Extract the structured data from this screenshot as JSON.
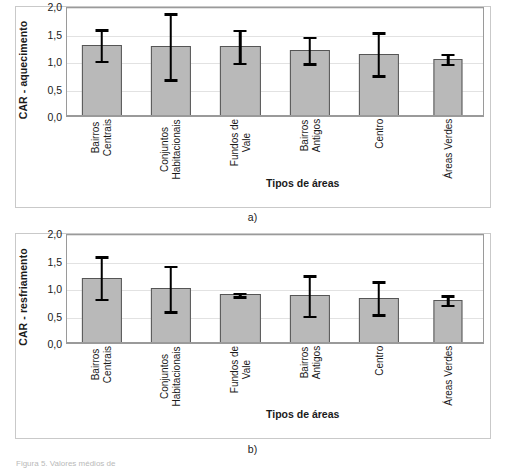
{
  "figure": {
    "panel_label_a": "a)",
    "panel_label_b": "b)",
    "caption_partial": "Figura 5. Valores médios de"
  },
  "axis": {
    "xlabel": "Tipos de áreas",
    "ticks": [
      "2,0",
      "1,5",
      "1,0",
      "0,5",
      "0,0"
    ]
  },
  "chart_data": [
    {
      "type": "bar",
      "title": "",
      "panel": "a)",
      "ylabel": "CAR - aquecimento",
      "xlabel": "Tipos de áreas",
      "ylim": [
        0,
        2.0
      ],
      "ytick_values": [
        0.0,
        0.5,
        1.0,
        1.5,
        2.0
      ],
      "ytick_labels": [
        "0,0",
        "0,5",
        "1,0",
        "1,5",
        "2,0"
      ],
      "grid": true,
      "legend": "none",
      "error_bars": "symmetric",
      "categories": [
        "Bairros Centrais",
        "Conjuntos Habitacionais",
        "Fundos de Vale",
        "Bairros Antigos",
        "Centro",
        "Áreas Verdes"
      ],
      "category_lines": [
        [
          "Bairros",
          "Centrais"
        ],
        [
          "Conjuntos",
          "Habitacionais"
        ],
        [
          "Fundos de",
          "Vale"
        ],
        [
          "Bairros",
          "Antigos"
        ],
        [
          "Centro"
        ],
        [
          "Áreas Verdes"
        ]
      ],
      "values": [
        1.31,
        1.29,
        1.29,
        1.22,
        1.15,
        1.06
      ],
      "errors": [
        0.29,
        0.6,
        0.3,
        0.24,
        0.39,
        0.09
      ],
      "err_low": [
        1.02,
        0.69,
        0.99,
        0.98,
        0.76,
        0.97
      ],
      "err_high": [
        1.6,
        1.89,
        1.59,
        1.46,
        1.54,
        1.15
      ]
    },
    {
      "type": "bar",
      "title": "",
      "panel": "b)",
      "ylabel": "CAR - resfriamento",
      "xlabel": "Tipos de áreas",
      "ylim": [
        0,
        2.0
      ],
      "ytick_values": [
        0.0,
        0.5,
        1.0,
        1.5,
        2.0
      ],
      "ytick_labels": [
        "0,0",
        "0,5",
        "1,0",
        "1,5",
        "2,0"
      ],
      "grid": true,
      "legend": "none",
      "error_bars": "symmetric",
      "categories": [
        "Bairros Centrais",
        "Conjuntos Habitacionais",
        "Fundos de Vale",
        "Bairros Antigos",
        "Centro",
        "Áreas Verdes"
      ],
      "category_lines": [
        [
          "Bairros",
          "Centrais"
        ],
        [
          "Conjuntos",
          "Habitacionais"
        ],
        [
          "Fundos de",
          "Vale"
        ],
        [
          "Bairros",
          "Antigos"
        ],
        [
          "Centro"
        ],
        [
          "Áreas Verdes"
        ]
      ],
      "values": [
        1.21,
        1.01,
        0.9,
        0.88,
        0.84,
        0.8
      ],
      "errors": [
        0.39,
        0.41,
        0.03,
        0.37,
        0.3,
        0.09
      ],
      "err_low": [
        0.82,
        0.6,
        0.87,
        0.51,
        0.54,
        0.71
      ],
      "err_high": [
        1.6,
        1.42,
        0.93,
        1.25,
        1.14,
        0.89
      ]
    }
  ],
  "style": {
    "bar_fill": "#b9b9b9",
    "bar_stroke": "#555555",
    "error_color": "#000000",
    "grid_color": "#e2e2e2",
    "frame_color": "#9a9a9a",
    "panel_border": "#c9c9c9"
  }
}
